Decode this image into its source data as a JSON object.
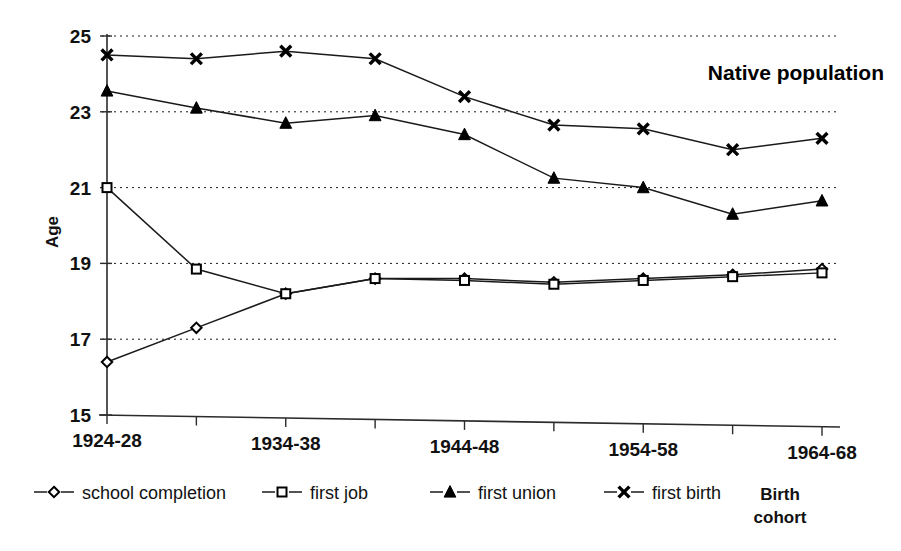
{
  "chart_data": {
    "type": "line",
    "title": "Native population",
    "xlabel": "Birth cohort",
    "ylabel": "Age",
    "ylim": [
      15,
      25
    ],
    "ytick_values": [
      15,
      17,
      19,
      21,
      23,
      25
    ],
    "ytick_labels": [
      "15",
      "17",
      "19",
      "21",
      "23",
      "25"
    ],
    "grid": true,
    "grid_axis": "y",
    "legend_position": "bottom",
    "categories": [
      "1924-28",
      "1929-33",
      "1934-38",
      "1939-43",
      "1944-48",
      "1949-53",
      "1954-58",
      "1959-63",
      "1964-68"
    ],
    "xtick_labels": [
      "1924-28",
      "",
      "1934-38",
      "",
      "1944-48",
      "",
      "1954-58",
      "",
      "1964-68"
    ],
    "series": [
      {
        "name": "school completion",
        "marker": "diamond-open",
        "values": [
          16.4,
          17.3,
          18.2,
          18.6,
          18.6,
          18.5,
          18.6,
          18.7,
          18.85
        ]
      },
      {
        "name": "first job",
        "marker": "square-open",
        "values": [
          21.0,
          18.85,
          18.2,
          18.6,
          18.55,
          18.45,
          18.55,
          18.65,
          18.75
        ]
      },
      {
        "name": "first union",
        "marker": "triangle-solid",
        "values": [
          23.55,
          23.1,
          22.7,
          22.9,
          22.4,
          21.25,
          21.0,
          20.3,
          20.65
        ]
      },
      {
        "name": "first birth",
        "marker": "cross",
        "values": [
          24.5,
          24.4,
          24.6,
          24.4,
          23.4,
          22.65,
          22.55,
          22.0,
          22.3
        ]
      }
    ]
  },
  "colors": {
    "ink": "#000000",
    "grid": "#1a1a1a",
    "background": "#ffffff"
  },
  "legend": {
    "items": [
      {
        "label": "school completion",
        "marker": "diamond-open"
      },
      {
        "label": "first job",
        "marker": "square-open"
      },
      {
        "label": "first union",
        "marker": "triangle-solid"
      },
      {
        "label": "first birth",
        "marker": "cross"
      }
    ]
  }
}
